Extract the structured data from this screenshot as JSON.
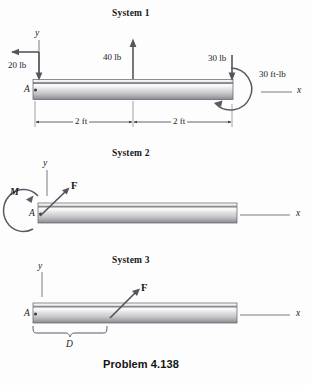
{
  "figure": {
    "caption": "Problem 4.138",
    "background_color": "#fdfdfd",
    "line_color": "#4a4a52",
    "beam_color_light": "#ececed",
    "beam_color_dark": "#8d8d92"
  },
  "systems": [
    {
      "title": "System 1",
      "origin_label": "A",
      "axis_y_label": "y",
      "axis_x_label": "x",
      "loads": [
        {
          "name": "left-point-load",
          "label": "20 lb",
          "direction": "down",
          "position": "A"
        },
        {
          "name": "mid-point-load",
          "label": "40 lb",
          "direction": "up",
          "position": "2 ft from A"
        },
        {
          "name": "right-point-load",
          "label": "30 lb",
          "direction": "down",
          "position": "4 ft from A"
        }
      ],
      "couple": {
        "name": "end-couple",
        "label": "30 ft-lb",
        "sense": "counterclockwise"
      },
      "dimensions": [
        {
          "label": "2 ft",
          "from": "A",
          "to": "mid"
        },
        {
          "label": "2 ft",
          "from": "mid",
          "to": "end"
        }
      ]
    },
    {
      "title": "System 2",
      "origin_label": "A",
      "axis_y_label": "y",
      "axis_x_label": "x",
      "loads": [
        {
          "name": "inclined-force",
          "label": "F",
          "direction": "up-right",
          "position": "A"
        }
      ],
      "couple": {
        "name": "moment-at-a",
        "label": "M",
        "sense": "counterclockwise"
      },
      "dimensions": []
    },
    {
      "title": "System 3",
      "origin_label": "A",
      "axis_y_label": "y",
      "axis_x_label": "x",
      "loads": [
        {
          "name": "inclined-force",
          "label": "F",
          "direction": "up-right",
          "position": "D from A"
        }
      ],
      "couple": null,
      "dimensions": [
        {
          "label": "D",
          "from": "A",
          "to": "force application point"
        }
      ]
    }
  ]
}
